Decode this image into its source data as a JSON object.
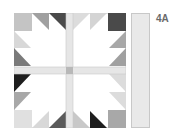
{
  "diagram": {
    "label": "4A",
    "pattern": "bear-paw-quilt-block",
    "colors": {
      "background": "#ffffff",
      "sashing": "#e6e6e6",
      "cornerstone": "#b8b8b8",
      "light": "#dcdcdc",
      "medium": "#a8a8a8",
      "dark": "#5a5a5a",
      "darkest": "#2a2a2a",
      "outline": "#c8c8c8",
      "strip": "#e9e9e9"
    }
  }
}
